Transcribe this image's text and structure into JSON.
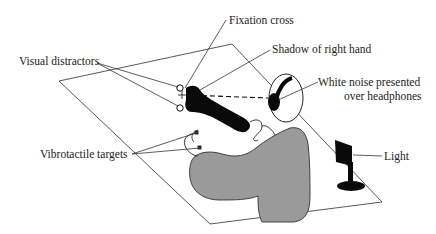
{
  "figure": {
    "labels": {
      "fixation_cross": "Fixation cross",
      "shadow_right_hand": "Shadow of right hand",
      "visual_distractors": "Visual distractors",
      "white_noise_line1": "White noise presented",
      "white_noise_line2": "over headphones",
      "vibrotactile_targets": "Vibrotactile targets",
      "light": "Light"
    },
    "colors": {
      "line": "#333333",
      "shadow": "#0a0a0a",
      "body_fill": "#9a9a9a",
      "background": "#ffffff"
    }
  }
}
